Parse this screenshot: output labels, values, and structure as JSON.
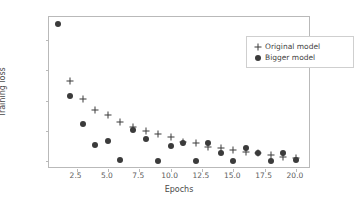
{
  "chart_data": {
    "type": "scatter",
    "title": "",
    "xlabel": "Epochs",
    "ylabel": "Training loss",
    "xlim": [
      0.3,
      21.2
    ],
    "ylim": [
      -0.025,
      0.475
    ],
    "grid": false,
    "legend_position": "upper right",
    "xticks": [
      "2.5",
      "5.0",
      "7.5",
      "10.0",
      "12.5",
      "15.0",
      "17.5",
      "20.0"
    ],
    "xtick_values": [
      2.5,
      5.0,
      7.5,
      10.0,
      12.5,
      15.0,
      17.5,
      20.0
    ],
    "yticks": [
      "0.0",
      "0.1",
      "0.2",
      "0.3",
      "0.4"
    ],
    "ytick_values": [
      0.0,
      0.1,
      0.2,
      0.3,
      0.4
    ],
    "series": [
      {
        "name": "Original model",
        "marker": "plus",
        "color": "#3b3b3b",
        "x": [
          2,
          3,
          4,
          5,
          6,
          7,
          8,
          9,
          10,
          11,
          12,
          13,
          14,
          15,
          16,
          17,
          18,
          19,
          20
        ],
        "values": [
          0.265,
          0.206,
          0.17,
          0.151,
          0.129,
          0.113,
          0.1,
          0.089,
          0.079,
          0.063,
          0.06,
          0.048,
          0.043,
          0.037,
          0.032,
          0.028,
          0.021,
          0.016,
          0.011
        ]
      },
      {
        "name": "Bigger model",
        "marker": "circle",
        "color": "#3b3b3b",
        "x": [
          1,
          2,
          3,
          4,
          5,
          6,
          7,
          8,
          9,
          10,
          11,
          12,
          13,
          14,
          15,
          16,
          17,
          18,
          19,
          20
        ],
        "values": [
          0.452,
          0.215,
          0.122,
          0.055,
          0.066,
          0.003,
          0.102,
          0.073,
          0.001,
          0.05,
          0.06,
          0.001,
          0.061,
          0.028,
          0.002,
          0.044,
          0.027,
          0.001,
          0.029,
          0.003
        ]
      }
    ]
  },
  "legend": {
    "entries": [
      {
        "label": "Original model",
        "marker": "plus-icon"
      },
      {
        "label": "Bigger model",
        "marker": "circle-icon"
      }
    ]
  },
  "axes": {
    "x_title": "Epochs",
    "y_title": "Training loss"
  }
}
